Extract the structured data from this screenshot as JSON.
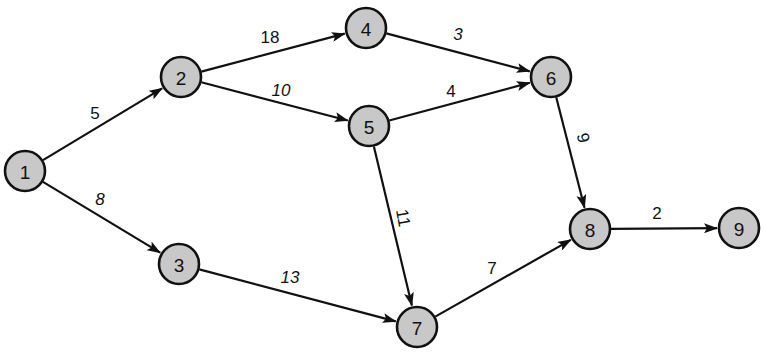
{
  "diagram": {
    "type": "directed-network",
    "colors": {
      "node_fill": "#c8c8c8",
      "stroke": "#111111",
      "background": "#ffffff"
    },
    "nodes": [
      {
        "id": "1",
        "label": "1",
        "x": 25,
        "y": 171
      },
      {
        "id": "2",
        "label": "2",
        "x": 181,
        "y": 77
      },
      {
        "id": "3",
        "label": "3",
        "x": 179,
        "y": 264
      },
      {
        "id": "4",
        "label": "4",
        "x": 366,
        "y": 28
      },
      {
        "id": "5",
        "label": "5",
        "x": 369,
        "y": 126
      },
      {
        "id": "6",
        "label": "6",
        "x": 551,
        "y": 77
      },
      {
        "id": "7",
        "label": "7",
        "x": 417,
        "y": 327
      },
      {
        "id": "8",
        "label": "8",
        "x": 590,
        "y": 229
      },
      {
        "id": "9",
        "label": "9",
        "x": 739,
        "y": 228
      }
    ],
    "edges": [
      {
        "from": "1",
        "to": "2",
        "weight": "5",
        "lx": 95,
        "ly": 113,
        "rot": 0,
        "italic": false
      },
      {
        "from": "1",
        "to": "3",
        "weight": "8",
        "lx": 100,
        "ly": 199,
        "rot": 0,
        "italic": true
      },
      {
        "from": "2",
        "to": "4",
        "weight": "18",
        "lx": 270,
        "ly": 37,
        "rot": 0,
        "italic": false
      },
      {
        "from": "2",
        "to": "5",
        "weight": "10",
        "lx": 281,
        "ly": 90,
        "rot": 0,
        "italic": true
      },
      {
        "from": "4",
        "to": "6",
        "weight": "3",
        "lx": 458,
        "ly": 34,
        "rot": 0,
        "italic": true
      },
      {
        "from": "5",
        "to": "6",
        "weight": "4",
        "lx": 451,
        "ly": 91,
        "rot": 0,
        "italic": false
      },
      {
        "from": "5",
        "to": "7",
        "weight": "11",
        "lx": 403,
        "ly": 218,
        "rot": 80,
        "italic": false
      },
      {
        "from": "3",
        "to": "7",
        "weight": "13",
        "lx": 290,
        "ly": 277,
        "rot": 0,
        "italic": true
      },
      {
        "from": "6",
        "to": "8",
        "weight": "9",
        "lx": 583,
        "ly": 138,
        "rot": 75,
        "italic": false
      },
      {
        "from": "7",
        "to": "8",
        "weight": "7",
        "lx": 492,
        "ly": 268,
        "rot": 0,
        "italic": false
      },
      {
        "from": "8",
        "to": "9",
        "weight": "2",
        "lx": 657,
        "ly": 213,
        "rot": 0,
        "italic": false
      }
    ],
    "node_radius": 20
  }
}
